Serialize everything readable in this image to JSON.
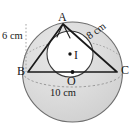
{
  "figure": {
    "type": "geometry-diagram",
    "colors": {
      "sphere_fill": "#d9d9d9",
      "sphere_stroke": "#6e6e6e",
      "incircle_fill": "#ffffff",
      "incircle_stroke": "#3a3a3a",
      "triangle_stroke": "#1a1a1a",
      "dashed_stroke": "#8a8a8a",
      "label_color": "#1a1a1a",
      "background": "#ffffff"
    },
    "points": {
      "A": {
        "label": "A",
        "x": 63,
        "y": 24
      },
      "B": {
        "label": "B",
        "x": 28,
        "y": 72
      },
      "C": {
        "label": "C",
        "x": 117,
        "y": 72
      },
      "O": {
        "label": "O",
        "x": 72.5,
        "y": 72
      },
      "I": {
        "label": "I",
        "x": 70,
        "y": 54
      }
    },
    "segments": [
      {
        "name": "AB",
        "from": "A",
        "to": "B",
        "length_label": "6 cm"
      },
      {
        "name": "AC",
        "from": "A",
        "to": "C",
        "length_label": "8 cm"
      },
      {
        "name": "BC",
        "from": "B",
        "to": "C",
        "length_label": "10 cm"
      }
    ],
    "labels": {
      "vertex_a": "A",
      "vertex_b": "B",
      "vertex_c": "C",
      "center_o": "O",
      "incenter_i": "I",
      "side_ab": "6 cm",
      "side_ac": "8 cm",
      "side_bc": "10 cm"
    },
    "circumcircle": {
      "center_x": 72.5,
      "center_y": 72,
      "radius": 50
    },
    "incircle": {
      "center_x": 70,
      "center_y": 54,
      "radius": 23
    }
  }
}
